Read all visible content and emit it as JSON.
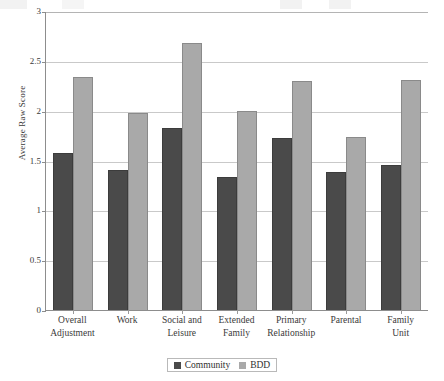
{
  "chart_data": {
    "type": "bar",
    "title": "",
    "xlabel": "",
    "ylabel": "Average Raw Score",
    "ylim": [
      0,
      3
    ],
    "yticks": [
      "0",
      "0.5",
      "1",
      "1.5",
      "2",
      "2.5",
      "3"
    ],
    "ytick_values": [
      0,
      0.5,
      1,
      1.5,
      2,
      2.5,
      3
    ],
    "grid": true,
    "legend_position": "bottom",
    "categories": [
      "Overall Adjustment",
      "Work",
      "Social and Leisure",
      "Extended Family",
      "Primary Relationship",
      "Parental",
      "Family Unit"
    ],
    "category_lines": [
      [
        "Overall",
        "Adjustment"
      ],
      [
        "Work",
        ""
      ],
      [
        "Social and",
        "Leisure"
      ],
      [
        "Extended",
        "Family"
      ],
      [
        "Primary",
        "Relationship"
      ],
      [
        "Parental",
        ""
      ],
      [
        "Family",
        "Unit"
      ]
    ],
    "series": [
      {
        "name": "Community",
        "color": "#4a4a4a",
        "values": [
          1.58,
          1.4,
          1.83,
          1.33,
          1.73,
          1.38,
          1.45
        ]
      },
      {
        "name": "BDD",
        "color": "#a9a9a9",
        "values": [
          2.34,
          1.98,
          2.68,
          2.0,
          2.3,
          1.74,
          2.31
        ]
      }
    ]
  },
  "legend": {
    "items": [
      {
        "label": "Community",
        "color": "#4a4a4a"
      },
      {
        "label": "BDD",
        "color": "#a9a9a9"
      }
    ]
  },
  "axis": {
    "y_title": "Average Raw Score"
  }
}
